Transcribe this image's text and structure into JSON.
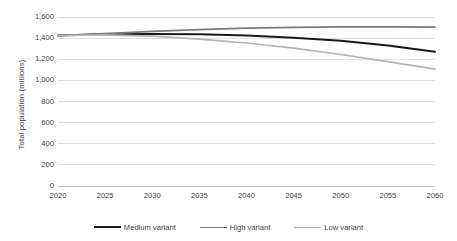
{
  "chart_data": {
    "type": "line",
    "title": "",
    "xlabel": "",
    "ylabel": "Total population (millions)",
    "xlim": [
      2020,
      2060
    ],
    "ylim": [
      0,
      1600
    ],
    "ytick_step": 200,
    "grid": true,
    "legend_position": "bottom",
    "x": [
      2020,
      2025,
      2030,
      2035,
      2040,
      2045,
      2050,
      2055,
      2060
    ],
    "xtick_labels": [
      "2020",
      "2025",
      "2030",
      "2035",
      "2040",
      "2045",
      "2050",
      "2055",
      "2060"
    ],
    "ytick_labels": [
      "0",
      "200",
      "400",
      "600",
      "800",
      "1,000",
      "1,200",
      "1,400",
      "1,600"
    ],
    "series": [
      {
        "name": "Medium variant",
        "color": "#1a1a1a",
        "width": 2.0,
        "values": [
          1425,
          1436,
          1440,
          1436,
          1424,
          1404,
          1375,
          1330,
          1272
        ]
      },
      {
        "name": "High variant",
        "color": "#7b7b7b",
        "width": 1.7,
        "values": [
          1425,
          1442,
          1463,
          1481,
          1494,
          1502,
          1506,
          1507,
          1505
        ]
      },
      {
        "name": "Low variant",
        "color": "#b4b4b4",
        "width": 1.7,
        "values": [
          1425,
          1430,
          1418,
          1391,
          1354,
          1306,
          1245,
          1178,
          1106
        ]
      }
    ]
  },
  "legend": {
    "items": [
      {
        "label": "Medium variant"
      },
      {
        "label": "High variant"
      },
      {
        "label": "Low variant"
      }
    ]
  },
  "axes": {
    "y_title": "Total population (millions)"
  },
  "style": {
    "grid_color": "#d9d9d9",
    "axis_color": "#bfbfbf",
    "text_color": "#3f3f3f",
    "background": "#ffffff"
  }
}
